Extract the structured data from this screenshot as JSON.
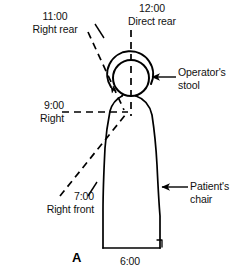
{
  "figure": {
    "panel_letter": "A",
    "caption_subject": "clock-position operator zones around patient chair",
    "width": 239,
    "height": 271,
    "ink_color": "#000000",
    "background_color": "#ffffff"
  },
  "labels": {
    "clock_1100": {
      "time": "11:00",
      "position": "Right rear"
    },
    "clock_1200": {
      "time": "12:00",
      "position": "Direct rear"
    },
    "clock_900": {
      "time": "9:00",
      "position": "Right"
    },
    "clock_700": {
      "time": "7:00",
      "position": "Right front"
    },
    "clock_600": {
      "time": "6:00"
    },
    "operator_stool": {
      "line1": "Operator's",
      "line2": "stool"
    },
    "patient_chair": {
      "line1": "Patient's",
      "line2": "chair"
    }
  },
  "diagram": {
    "head_center_x": 131,
    "head_center_y": 78,
    "head_radius": 18,
    "stool_arc_radius": 23,
    "chair_bottom_y": 248,
    "chair_left_x": 103,
    "chair_right_x": 160
  }
}
